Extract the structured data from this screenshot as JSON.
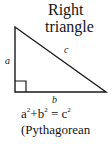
{
  "title": {
    "line1": "Right",
    "line2": "triangle"
  },
  "labels": {
    "a": "a",
    "b": "b",
    "c": "c"
  },
  "formula": {
    "a": "a",
    "a_exp": "2",
    "plus": "+",
    "b": "b",
    "b_exp": "2",
    "equals": " = ",
    "c": "c",
    "c_exp": "2"
  },
  "caption": "(Pythagorean",
  "colors": {
    "stroke": "#1a1a1a",
    "background": "#ffffff"
  }
}
